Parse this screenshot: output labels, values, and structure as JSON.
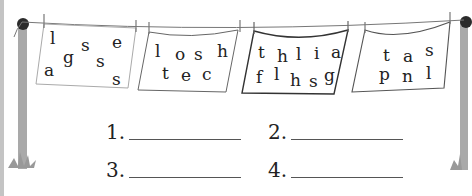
{
  "worksheet": {
    "cloths": [
      {
        "id": 1,
        "letters": [
          "l",
          "s",
          "e",
          "g",
          "s",
          "a",
          "s"
        ]
      },
      {
        "id": 2,
        "letters": [
          "l",
          "o",
          "s",
          "h",
          "t",
          "e",
          "c"
        ]
      },
      {
        "id": 3,
        "letters": [
          "t",
          "h",
          "l",
          "i",
          "a",
          "f",
          "l",
          "h",
          "s",
          "g"
        ]
      },
      {
        "id": 4,
        "letters": [
          "t",
          "a",
          "s",
          "p",
          "n",
          "l"
        ]
      }
    ],
    "answers": [
      {
        "number": "1.",
        "value": ""
      },
      {
        "number": "2.",
        "value": ""
      },
      {
        "number": "3.",
        "value": ""
      },
      {
        "number": "4.",
        "value": ""
      }
    ]
  },
  "colors": {
    "pole": "#a9a9a9",
    "knob": "#2b2b2b",
    "line": "#666666",
    "cloth_border_light": "#9a9a9a",
    "cloth_border_dark": "#333333",
    "text": "#222222"
  }
}
